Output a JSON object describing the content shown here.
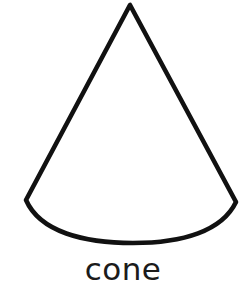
{
  "figure": {
    "kind": "geometric-solid-outline-illustration",
    "caption": "cone",
    "background_color": "#ffffff",
    "stroke_color": "#111111",
    "stroke_width": 4.6,
    "fill": "none",
    "canvas": {
      "width": 246,
      "height": 287
    },
    "shape": {
      "name": "cone",
      "apex": {
        "x": 130,
        "y": 5
      },
      "base_left_corner": {
        "x": 26,
        "y": 200
      },
      "base_right_corner": {
        "x": 236,
        "y": 202
      },
      "base_arc_lowest_point": {
        "x": 133,
        "y": 243
      },
      "hidden_back_edge_drawn": false,
      "outline_path": "M 130 5 L 26 200 C 40 232 84 243 133 243 C 183 243 222 231 236 202 Z"
    },
    "caption_box": {
      "x": 87,
      "y": 262,
      "width": 95,
      "height": 21
    }
  }
}
